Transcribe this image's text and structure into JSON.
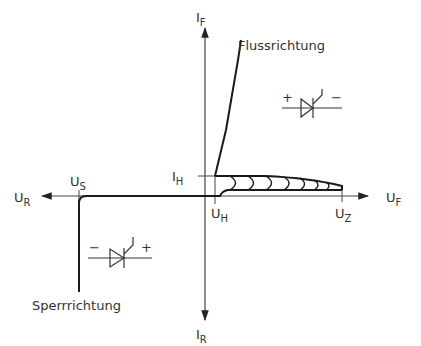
{
  "diagram": {
    "type": "thyristor-diode characteristic curve",
    "axes": {
      "y_positive_label": "I",
      "y_positive_sub": "F",
      "y_negative_label": "I",
      "y_negative_sub": "R",
      "x_positive_label": "U",
      "x_positive_sub": "F",
      "x_negative_label": "U",
      "x_negative_sub": "R"
    },
    "markers": {
      "holding_current": {
        "label": "I",
        "sub": "H"
      },
      "holding_voltage": {
        "label": "U",
        "sub": "H"
      },
      "breakover_voltage": {
        "label": "U",
        "sub": "Z"
      },
      "breakdown_voltage": {
        "label": "U",
        "sub": "S"
      }
    },
    "regions": {
      "forward": "Flussrichtung",
      "reverse": "Sperrrichtung"
    },
    "symbols": {
      "forward_symbol": {
        "left_sign": "+",
        "right_sign": "−"
      },
      "reverse_symbol": {
        "left_sign": "−",
        "right_sign": "+"
      }
    },
    "colors": {
      "line": "#1a1a1a",
      "axis": "#333333",
      "text": "#333333"
    }
  }
}
